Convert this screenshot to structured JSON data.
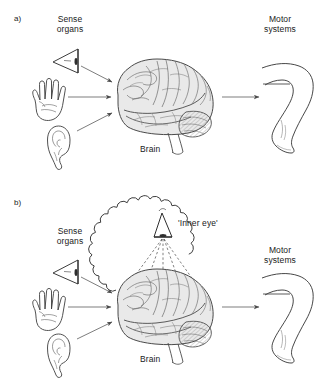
{
  "figure": {
    "background_color": "#ffffff",
    "ink_color": "#333333",
    "brain_fill": "#e9e9e9",
    "line_color": "#555555"
  },
  "panels": [
    {
      "tag": "a)",
      "labels": {
        "sense_organs_line1": "Sense",
        "sense_organs_line2": "organs",
        "motor_line1": "Motor",
        "motor_line2": "systems",
        "brain": "Brain"
      },
      "icons": [
        {
          "name": "eye-icon",
          "label": "eye"
        },
        {
          "name": "hand-icon",
          "label": "hand"
        },
        {
          "name": "ear-icon",
          "label": "ear"
        },
        {
          "name": "brain-illustration",
          "label": "brain"
        },
        {
          "name": "leg-illustration",
          "label": "leg"
        }
      ],
      "arrows": [
        {
          "from": "eye-icon",
          "to": "brain-illustration"
        },
        {
          "from": "hand-icon",
          "to": "brain-illustration"
        },
        {
          "from": "ear-icon",
          "to": "brain-illustration"
        },
        {
          "from": "brain-illustration",
          "to": "leg-illustration"
        }
      ]
    },
    {
      "tag": "b)",
      "labels": {
        "sense_organs_line1": "Sense",
        "sense_organs_line2": "organs",
        "motor_line1": "Motor",
        "motor_line2": "systems",
        "brain": "Brain",
        "inner_eye": "'Inner eye'"
      },
      "icons": [
        {
          "name": "eye-icon",
          "label": "eye"
        },
        {
          "name": "hand-icon",
          "label": "hand"
        },
        {
          "name": "ear-icon",
          "label": "ear"
        },
        {
          "name": "brain-illustration",
          "label": "brain"
        },
        {
          "name": "leg-illustration",
          "label": "leg"
        },
        {
          "name": "thought-bubble",
          "label": "thought bubble"
        },
        {
          "name": "inner-eye-icon",
          "label": "inner eye"
        }
      ],
      "arrows": [
        {
          "from": "eye-icon",
          "to": "brain-illustration"
        },
        {
          "from": "hand-icon",
          "to": "brain-illustration"
        },
        {
          "from": "ear-icon",
          "to": "brain-illustration"
        },
        {
          "from": "brain-illustration",
          "to": "leg-illustration"
        }
      ]
    }
  ]
}
